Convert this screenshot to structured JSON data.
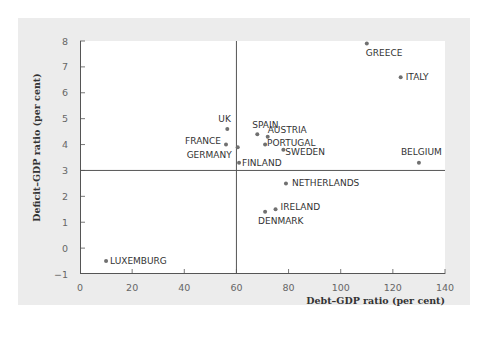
{
  "chart_data": {
    "type": "scatter",
    "title": "",
    "xlabel": "Debt–GDP ratio (per cent)",
    "ylabel": "Deficit–GDP ratio (per cent)",
    "xlim": [
      0,
      140
    ],
    "ylim": [
      -1,
      8
    ],
    "x_ticks": [
      0,
      20,
      40,
      60,
      80,
      100,
      120,
      140
    ],
    "y_ticks": [
      -1,
      0,
      1,
      2,
      3,
      4,
      5,
      6,
      7,
      8
    ],
    "grid": false,
    "legend": null,
    "reference_lines": {
      "x": 60,
      "y": 3
    },
    "points": [
      {
        "label": "GREECE",
        "x": 110,
        "y": 7.9
      },
      {
        "label": "ITALY",
        "x": 123,
        "y": 6.6
      },
      {
        "label": "BELGIUM",
        "x": 130,
        "y": 3.3
      },
      {
        "label": "UK",
        "x": 56.5,
        "y": 4.6
      },
      {
        "label": "FRANCE",
        "x": 56,
        "y": 4.0
      },
      {
        "label": "GERMANY",
        "x": 60.5,
        "y": 3.9
      },
      {
        "label": "FINLAND",
        "x": 61,
        "y": 3.3
      },
      {
        "label": "SPAIN",
        "x": 68,
        "y": 4.4
      },
      {
        "label": "AUSTRIA",
        "x": 72,
        "y": 4.3
      },
      {
        "label": "PORTUGAL",
        "x": 71,
        "y": 4.0
      },
      {
        "label": "SWEDEN",
        "x": 78,
        "y": 3.8
      },
      {
        "label": "NETHERLANDS",
        "x": 79,
        "y": 2.5
      },
      {
        "label": "IRELAND",
        "x": 75,
        "y": 1.5
      },
      {
        "label": "DENMARK",
        "x": 71,
        "y": 1.4
      },
      {
        "label": "LUXEMBURG",
        "x": 10,
        "y": -0.5
      }
    ]
  },
  "colors": {
    "card_bg": "#ececec",
    "plot_bg": "#ffffff",
    "point": "#707070",
    "line": "#555555",
    "text": "#333333"
  }
}
